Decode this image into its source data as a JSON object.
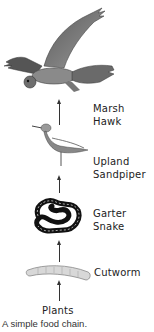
{
  "diagram": {
    "type": "food-chain",
    "caption": "A simple food chain.",
    "levels": [
      {
        "name": "Marsh Hawk",
        "line1": "Marsh",
        "line2": "Hawk",
        "icon": "hawk-icon"
      },
      {
        "name": "Upland Sandpiper",
        "line1": "Upland",
        "line2": "Sandpiper",
        "icon": "sandpiper-icon"
      },
      {
        "name": "Garter Snake",
        "line1": "Garter",
        "line2": "Snake",
        "icon": "snake-icon"
      },
      {
        "name": "Cutworm",
        "line1": "Cutworm",
        "icon": "cutworm-icon"
      },
      {
        "name": "Plants",
        "line1": "Plants"
      }
    ],
    "arrow_direction": "up"
  }
}
